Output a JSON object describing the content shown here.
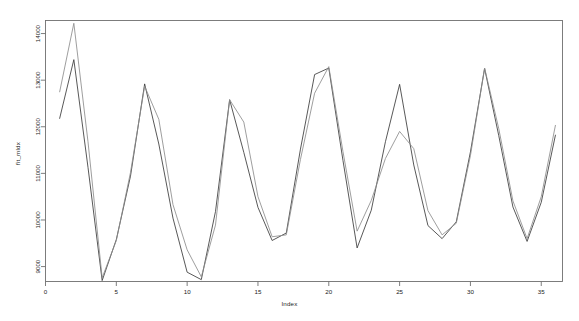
{
  "chart_data": {
    "type": "line",
    "title": "",
    "xlabel": "Index",
    "ylabel": "fit_mldx",
    "xlim": [
      0,
      36.5
    ],
    "ylim": [
      8680,
      14280
    ],
    "xticks": [
      0,
      5,
      10,
      15,
      20,
      25,
      30,
      35
    ],
    "yticks": [
      9000,
      10000,
      11000,
      12000,
      13000,
      14000
    ],
    "xticklabels": [
      "0",
      "5",
      "10",
      "15",
      "20",
      "25",
      "30",
      "35"
    ],
    "yticklabels": [
      "9000",
      "10000",
      "11000",
      "12000",
      "13000",
      "14000"
    ],
    "grid": false,
    "legend": false,
    "box": true,
    "x": [
      1,
      2,
      3,
      4,
      5,
      6,
      7,
      8,
      9,
      10,
      11,
      12,
      13,
      14,
      15,
      16,
      17,
      18,
      19,
      20,
      21,
      22,
      23,
      24,
      25,
      26,
      27,
      28,
      29,
      30,
      31,
      32,
      33,
      34,
      35,
      36
    ],
    "series": [
      {
        "name": "observed",
        "color": "#3a3a3a",
        "values": [
          12180,
          13440,
          11130,
          8700,
          9580,
          10940,
          12920,
          11630,
          10040,
          8880,
          8720,
          10180,
          12580,
          11450,
          10270,
          9560,
          9720,
          11520,
          13120,
          13260,
          11280,
          9400,
          10210,
          11680,
          12910,
          11180,
          9880,
          9600,
          9960,
          11460,
          13250,
          11810,
          10280,
          9540,
          10380,
          11820
        ]
      },
      {
        "name": "fitted",
        "color": "#8c8c8c",
        "values": [
          12750,
          14220,
          11680,
          8760,
          9560,
          11020,
          12870,
          12160,
          10330,
          9360,
          8780,
          9890,
          12580,
          12100,
          10500,
          9640,
          9680,
          11300,
          12720,
          13290,
          11470,
          9760,
          10420,
          11320,
          11900,
          11530,
          10200,
          9680,
          9930,
          11380,
          13260,
          11960,
          10410,
          9600,
          10500,
          12030
        ]
      }
    ]
  }
}
